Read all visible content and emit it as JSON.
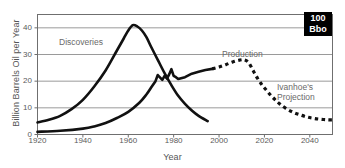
{
  "chart_data": {
    "type": "line",
    "title": "",
    "xlabel": "Year",
    "ylabel": "Billion Barrels Oil per Year",
    "xlim": [
      1920,
      2050
    ],
    "ylim": [
      0,
      45
    ],
    "xticks": [
      1920,
      1940,
      1960,
      1980,
      2000,
      2020,
      2040
    ],
    "yticks": [
      0,
      10,
      20,
      30,
      40
    ],
    "grid": "horizontal",
    "legend": "inline-annotations",
    "annotations": [
      {
        "text": "Discoveries",
        "x": 1940,
        "y": 35
      },
      {
        "text": "Production",
        "x": 2003,
        "y": 31
      },
      {
        "text": "Ivanhoe's Projection",
        "x": 2028,
        "y": 18
      }
    ],
    "badge": {
      "line1": "100",
      "line2": "Bbo"
    },
    "series": [
      {
        "name": "Discoveries",
        "style": "solid",
        "points": [
          [
            1920,
            4.5
          ],
          [
            1925,
            5.5
          ],
          [
            1930,
            7.0
          ],
          [
            1935,
            9.5
          ],
          [
            1940,
            13.0
          ],
          [
            1945,
            18.0
          ],
          [
            1950,
            24.0
          ],
          [
            1955,
            31.5
          ],
          [
            1958,
            36.0
          ],
          [
            1960,
            39.0
          ],
          [
            1962,
            41.0
          ],
          [
            1964,
            40.5
          ],
          [
            1966,
            39.0
          ],
          [
            1968,
            36.5
          ],
          [
            1970,
            33.0
          ],
          [
            1973,
            28.0
          ],
          [
            1976,
            23.0
          ],
          [
            1979,
            18.5
          ],
          [
            1982,
            14.5
          ],
          [
            1985,
            11.5
          ],
          [
            1988,
            9.0
          ],
          [
            1991,
            7.0
          ],
          [
            1995,
            5.0
          ]
        ]
      },
      {
        "name": "Production",
        "style": "solid",
        "points": [
          [
            1920,
            1.0
          ],
          [
            1930,
            1.4
          ],
          [
            1940,
            2.2
          ],
          [
            1945,
            3.0
          ],
          [
            1950,
            4.3
          ],
          [
            1955,
            6.2
          ],
          [
            1960,
            8.5
          ],
          [
            1965,
            12.0
          ],
          [
            1968,
            15.0
          ],
          [
            1970,
            17.5
          ],
          [
            1972,
            20.0
          ],
          [
            1973,
            22.3
          ],
          [
            1975,
            20.5
          ],
          [
            1976,
            22.0
          ],
          [
            1977,
            21.0
          ],
          [
            1978,
            22.5
          ],
          [
            1979,
            24.5
          ],
          [
            1980,
            22.0
          ],
          [
            1981,
            21.5
          ],
          [
            1982,
            20.8
          ],
          [
            1985,
            21.5
          ],
          [
            1988,
            22.8
          ],
          [
            1991,
            23.5
          ],
          [
            1994,
            24.2
          ],
          [
            1997,
            24.6
          ]
        ]
      },
      {
        "name": "Ivanhoe's Projection",
        "style": "dashed",
        "points": [
          [
            1997,
            24.6
          ],
          [
            2000,
            25.3
          ],
          [
            2003,
            26.2
          ],
          [
            2006,
            27.2
          ],
          [
            2009,
            27.9
          ],
          [
            2011,
            28.0
          ],
          [
            2013,
            27.0
          ],
          [
            2015,
            24.0
          ],
          [
            2017,
            21.0
          ],
          [
            2019,
            18.5
          ],
          [
            2021,
            16.5
          ],
          [
            2023,
            14.5
          ],
          [
            2025,
            12.8
          ],
          [
            2027,
            11.3
          ],
          [
            2030,
            9.5
          ],
          [
            2033,
            8.2
          ],
          [
            2036,
            7.3
          ],
          [
            2039,
            6.5
          ],
          [
            2042,
            6.0
          ],
          [
            2045,
            5.7
          ],
          [
            2048,
            5.5
          ],
          [
            2050,
            5.5
          ]
        ]
      }
    ]
  },
  "axes": {
    "ylabel": "Billion Barrels Oil per Year",
    "xlabel": "Year",
    "xticks": [
      "1920",
      "1940",
      "1960",
      "1980",
      "2000",
      "2020",
      "2040"
    ],
    "yticks": [
      "40",
      "30",
      "20",
      "10",
      "0"
    ]
  },
  "labels": {
    "discoveries": "Discoveries",
    "production": "Production",
    "ivanhoe_line1": "Ivanhoe's",
    "ivanhoe_line2": "Projection"
  },
  "badge": {
    "amount": "100",
    "unit": "Bbo"
  },
  "colors": {
    "curve": "#111111",
    "grid": "#9a9a9a",
    "frame": "#6f6f6f",
    "text": "#5a5a5a",
    "badge_bg": "#000000",
    "badge_text": "#ffffff"
  }
}
